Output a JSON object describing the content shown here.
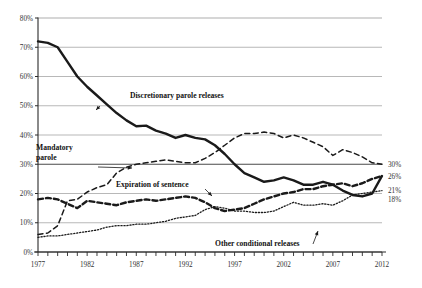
{
  "chart_data": {
    "type": "line",
    "title": "",
    "subtitle": "",
    "xlabel": "",
    "ylabel": "",
    "xlim": [
      1977,
      2012
    ],
    "ylim": [
      0,
      80
    ],
    "grid": true,
    "legend_position": "inline-annotations",
    "x": [
      1977,
      1978,
      1979,
      1980,
      1981,
      1982,
      1983,
      1984,
      1985,
      1986,
      1987,
      1988,
      1989,
      1990,
      1991,
      1992,
      1993,
      1994,
      1995,
      1996,
      1997,
      1998,
      1999,
      2000,
      2001,
      2002,
      2003,
      2004,
      2005,
      2006,
      2007,
      2008,
      2009,
      2010,
      2011,
      2012
    ],
    "y_ticks": [
      0,
      10,
      20,
      30,
      40,
      50,
      60,
      70,
      80
    ],
    "y_tick_labels": [
      "0%",
      "10%",
      "20%",
      "30%",
      "40%",
      "50%",
      "60%",
      "70%",
      "80%"
    ],
    "x_tick_labels": [
      "1977",
      "1982",
      "1987",
      "1992",
      "1997",
      "2002",
      "2007",
      "2012"
    ],
    "x_tick_label_years": [
      1977,
      1982,
      1987,
      1992,
      1997,
      2002,
      2007,
      2012
    ],
    "end_labels": [
      {
        "value": "30%",
        "series": "Mandatory parole",
        "y": 30
      },
      {
        "value": "26%",
        "series": "Expiration of sentence",
        "y": 26
      },
      {
        "value": "21%",
        "series": "Other conditional releases",
        "y": 21
      },
      {
        "value": "18%",
        "series": "Discretionary parole releases",
        "y": 18
      }
    ],
    "series": [
      {
        "name": "Discretionary parole releases",
        "style": "solid",
        "width": 2.4,
        "color": "#1a1a1a",
        "values": [
          72.0,
          71.5,
          70.0,
          65.0,
          60.0,
          56.5,
          53.5,
          50.5,
          47.5,
          45.0,
          43.0,
          43.2,
          41.5,
          40.5,
          39.0,
          40.0,
          39.0,
          38.5,
          36.5,
          33.5,
          30.0,
          27.0,
          25.5,
          24.0,
          24.5,
          25.5,
          24.5,
          23.0,
          23.0,
          24.0,
          23.0,
          21.0,
          19.5,
          19.0,
          20.0,
          26.0
        ]
      },
      {
        "name": "Mandatory parole",
        "style": "dashed",
        "width": 1.5,
        "color": "#1a1a1a",
        "values": [
          6.0,
          6.5,
          9.0,
          17.5,
          18.0,
          20.5,
          22.0,
          23.0,
          27.0,
          29.0,
          30.0,
          30.5,
          31.0,
          31.5,
          31.0,
          30.5,
          30.5,
          32.0,
          34.0,
          36.5,
          39.0,
          40.5,
          40.5,
          41.0,
          40.5,
          39.0,
          40.0,
          39.0,
          37.5,
          36.0,
          33.0,
          35.0,
          34.0,
          32.5,
          30.5,
          30.0
        ]
      },
      {
        "name": "Expiration of sentence",
        "style": "dashed-bold",
        "width": 2.4,
        "color": "#1a1a1a",
        "values": [
          18.0,
          18.5,
          18.0,
          16.5,
          15.0,
          17.5,
          17.0,
          16.5,
          16.0,
          17.0,
          17.5,
          18.0,
          17.5,
          18.0,
          18.5,
          19.0,
          18.5,
          17.0,
          15.0,
          14.0,
          14.5,
          15.0,
          16.5,
          18.0,
          19.0,
          20.0,
          20.5,
          21.5,
          21.5,
          22.5,
          23.0,
          23.5,
          22.5,
          23.5,
          25.0,
          26.0
        ]
      },
      {
        "name": "Other conditional releases",
        "style": "dotted",
        "width": 1.3,
        "color": "#1a1a1a",
        "values": [
          5.0,
          5.5,
          5.5,
          6.0,
          6.5,
          7.0,
          7.5,
          8.5,
          9.0,
          9.0,
          9.5,
          9.5,
          10.0,
          10.5,
          11.5,
          12.0,
          12.5,
          14.5,
          15.5,
          15.0,
          14.0,
          14.0,
          13.5,
          13.5,
          14.0,
          15.5,
          17.0,
          16.0,
          16.0,
          16.5,
          16.0,
          17.5,
          19.5,
          20.0,
          20.5,
          21.0
        ]
      }
    ],
    "annotations": [
      {
        "id": "discretionary",
        "text": "Discretionary parole releases",
        "text_lines": [
          "Discretionary parole releases"
        ],
        "tx": 130,
        "ty": 98,
        "ax": 100,
        "ay": 106,
        "px": 96,
        "py": 110
      },
      {
        "id": "mandatory",
        "text": "Mandatory parole",
        "text_lines": [
          "Mandatory",
          "parole"
        ],
        "tx": 36,
        "ty": 150,
        "ax": 98,
        "ay": 167,
        "px": 132,
        "py": 168
      },
      {
        "id": "expiration",
        "text": "Expiration of sentence",
        "text_lines": [
          "Expiration of sentence"
        ],
        "tx": 116,
        "ty": 187,
        "ax": 205,
        "ay": 189,
        "px": 212,
        "py": 196
      },
      {
        "id": "other-conditional",
        "text": "Other conditional releases",
        "text_lines": [
          "Other conditional releases"
        ],
        "tx": 215,
        "ty": 246,
        "ax": 313,
        "ay": 244,
        "px": 318,
        "py": 231
      }
    ]
  }
}
